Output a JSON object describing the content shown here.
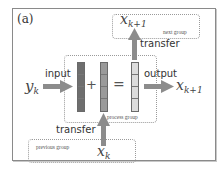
{
  "panel_label": "(a)",
  "groups": {
    "next": {
      "label": "next group",
      "symbol": "x",
      "subscript": "k+1"
    },
    "process": {
      "label": "process group"
    },
    "previous": {
      "label": "previous group",
      "symbol": "x",
      "subscript": "k"
    }
  },
  "edges": {
    "input": {
      "label": "input",
      "from_symbol": "y",
      "from_subscript": "k"
    },
    "output": {
      "label": "output",
      "to_symbol": "x",
      "to_subscript": "k+1"
    },
    "transfer_top": {
      "label": "transfer"
    },
    "transfer_bottom": {
      "label": "transfer"
    }
  },
  "operators": {
    "plus": "+",
    "equals": "="
  },
  "vectors": [
    {
      "name": "input-vector",
      "color": "#6e6e6e",
      "cells": 4
    },
    {
      "name": "state-vector",
      "color": "#9a9a9a",
      "cells": 4
    },
    {
      "name": "result-vector",
      "color": "#dcdcdc",
      "cells": 4
    }
  ],
  "colors": {
    "arrow": "#8c8c8c",
    "border": "#8a8a8a"
  }
}
